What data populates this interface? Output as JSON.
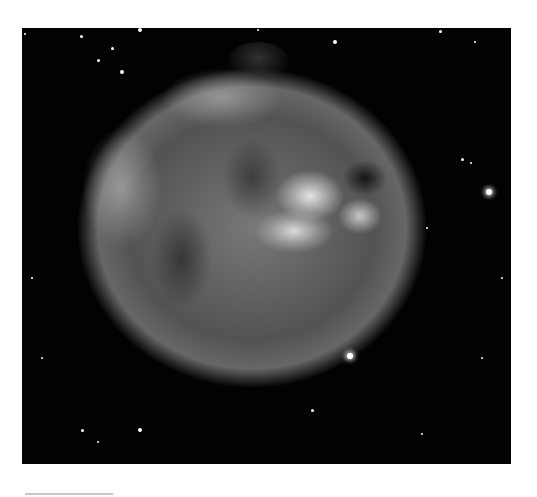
{
  "image": {
    "subject": "supernova remnant nebula (grayscale astronomical image)",
    "background_color": "#020202",
    "page_background": "#ffffff",
    "stars": [
      {
        "x": 467,
        "y": 164,
        "r": 3
      },
      {
        "x": 328,
        "y": 328,
        "r": 3
      },
      {
        "x": 313,
        "y": 14,
        "r": 2
      },
      {
        "x": 90,
        "y": 20,
        "r": 1.5
      },
      {
        "x": 76,
        "y": 32,
        "r": 1.5
      },
      {
        "x": 100,
        "y": 44,
        "r": 2
      },
      {
        "x": 418,
        "y": 3,
        "r": 1.5
      },
      {
        "x": 453,
        "y": 14,
        "r": 1
      },
      {
        "x": 3,
        "y": 6,
        "r": 1
      },
      {
        "x": 59,
        "y": 8,
        "r": 1.5
      },
      {
        "x": 118,
        "y": 2,
        "r": 2
      },
      {
        "x": 236,
        "y": 2,
        "r": 1
      },
      {
        "x": 440,
        "y": 131,
        "r": 1.5
      },
      {
        "x": 449,
        "y": 135,
        "r": 1
      },
      {
        "x": 405,
        "y": 200,
        "r": 1
      },
      {
        "x": 480,
        "y": 250,
        "r": 1
      },
      {
        "x": 290,
        "y": 382,
        "r": 1.5
      },
      {
        "x": 400,
        "y": 406,
        "r": 1
      },
      {
        "x": 460,
        "y": 330,
        "r": 1
      },
      {
        "x": 60,
        "y": 402,
        "r": 1.5
      },
      {
        "x": 76,
        "y": 414,
        "r": 1
      },
      {
        "x": 118,
        "y": 402,
        "r": 2
      },
      {
        "x": 20,
        "y": 330,
        "r": 1
      },
      {
        "x": 10,
        "y": 250,
        "r": 1
      }
    ]
  },
  "scale_bar": {
    "color": "#c8c8c8"
  }
}
